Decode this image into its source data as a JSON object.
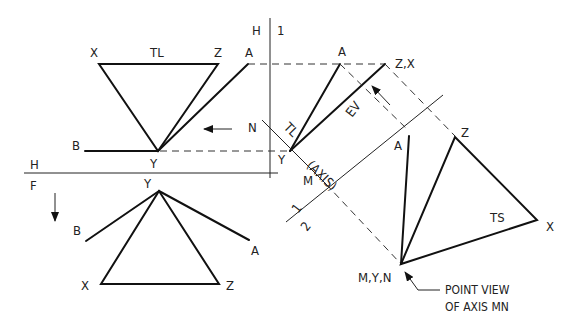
{
  "diagram": {
    "top_view": {
      "labels": {
        "X": "X",
        "TL": "TL",
        "Z": "Z",
        "A": "A",
        "B": "B",
        "Y": "Y"
      }
    },
    "front_view": {
      "labels": {
        "Y": "Y",
        "B": "B",
        "A": "A",
        "X": "X",
        "Z": "Z"
      }
    },
    "fold_lines": {
      "HF": {
        "upper": "H",
        "lower": "F"
      },
      "H1": {
        "left": "H",
        "right": "1"
      },
      "12": {
        "upper": "1",
        "lower": "2"
      }
    },
    "aux_view_1": {
      "labels": {
        "A": "A",
        "ZX": "Z,X",
        "EV": "EV",
        "N": "N",
        "Y": "Y",
        "TL": "TL",
        "axis": "(AXIS)",
        "M": "M"
      }
    },
    "aux_view_2": {
      "labels": {
        "A": "A",
        "Z": "Z",
        "X": "X",
        "TS": "TS",
        "MYN": "M,Y,N"
      }
    },
    "notes": {
      "point_view_line1": "POINT VIEW",
      "point_view_line2": "OF AXIS MN"
    }
  }
}
